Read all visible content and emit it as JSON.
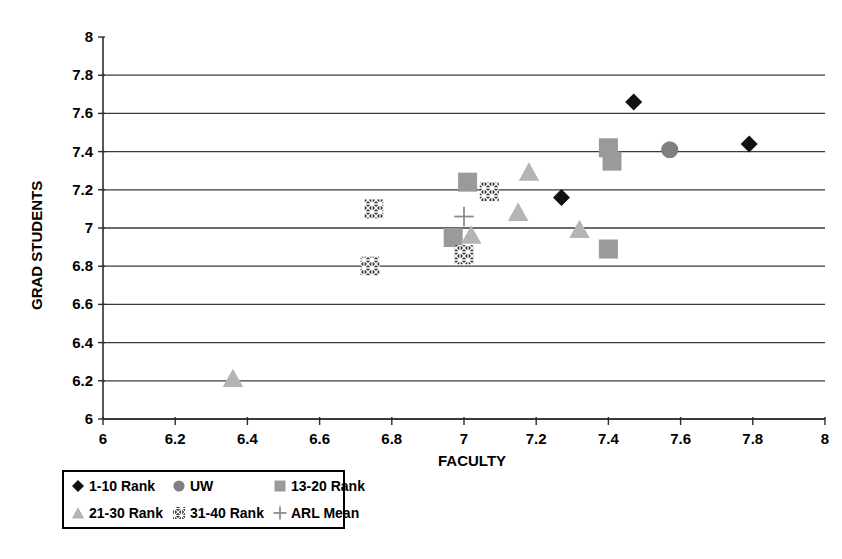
{
  "chart_data": {
    "type": "scatter",
    "title": "",
    "xlabel": "FACULTY",
    "ylabel": "GRAD STUDENTS",
    "xlim": [
      6,
      8
    ],
    "ylim": [
      6,
      8
    ],
    "xticks": [
      "6",
      "6.2",
      "6.4",
      "6.6",
      "6.8",
      "7",
      "7.2",
      "7.4",
      "7.6",
      "7.8",
      "8"
    ],
    "yticks": [
      "6",
      "6.2",
      "6.4",
      "6.6",
      "6.8",
      "7",
      "7.2",
      "7.4",
      "7.6",
      "7.8",
      "8"
    ],
    "xtick_values": [
      6,
      6.2,
      6.4,
      6.6,
      6.8,
      7,
      7.2,
      7.4,
      7.6,
      7.8,
      8
    ],
    "ytick_values": [
      6,
      6.2,
      6.4,
      6.6,
      6.8,
      7,
      7.2,
      7.4,
      7.6,
      7.8,
      8
    ],
    "grid": "horizontal-only",
    "legend_position": "below-left",
    "series": [
      {
        "name": "1-10 Rank",
        "marker": "diamond",
        "color": "#111111",
        "points": [
          {
            "x": 7.47,
            "y": 7.66
          },
          {
            "x": 7.79,
            "y": 7.44
          },
          {
            "x": 7.27,
            "y": 7.16
          }
        ]
      },
      {
        "name": "UW",
        "marker": "circle",
        "color": "#808080",
        "points": [
          {
            "x": 7.57,
            "y": 7.41
          }
        ]
      },
      {
        "name": "13-20 Rank",
        "marker": "square",
        "color": "#9a9a9a",
        "points": [
          {
            "x": 7.4,
            "y": 7.42
          },
          {
            "x": 7.41,
            "y": 7.35
          },
          {
            "x": 7.01,
            "y": 7.24
          },
          {
            "x": 6.97,
            "y": 6.95
          },
          {
            "x": 7.4,
            "y": 6.89
          }
        ]
      },
      {
        "name": "21-30 Rank",
        "marker": "triangle",
        "color": "#b4b4b4",
        "points": [
          {
            "x": 7.18,
            "y": 7.29
          },
          {
            "x": 7.15,
            "y": 7.08
          },
          {
            "x": 7.32,
            "y": 6.99
          },
          {
            "x": 7.02,
            "y": 6.96
          },
          {
            "x": 6.36,
            "y": 6.21
          }
        ]
      },
      {
        "name": "31-40 Rank",
        "marker": "hatched-square",
        "color": "#3c3c3c",
        "points": [
          {
            "x": 7.07,
            "y": 7.19
          },
          {
            "x": 6.75,
            "y": 7.1
          },
          {
            "x": 7.0,
            "y": 6.86
          },
          {
            "x": 6.74,
            "y": 6.8
          }
        ]
      },
      {
        "name": "ARL Mean",
        "marker": "plus",
        "color": "#8c8c8c",
        "points": [
          {
            "x": 7.0,
            "y": 7.06
          }
        ]
      }
    ]
  },
  "legend": {
    "entries": [
      {
        "label": "1-10 Rank",
        "marker": "diamond",
        "color": "#111111"
      },
      {
        "label": "UW",
        "marker": "circle",
        "color": "#808080"
      },
      {
        "label": "13-20 Rank",
        "marker": "square",
        "color": "#9a9a9a"
      },
      {
        "label": "21-30 Rank",
        "marker": "triangle",
        "color": "#b4b4b4"
      },
      {
        "label": "31-40 Rank",
        "marker": "hatched-square",
        "color": "#3c3c3c"
      },
      {
        "label": "ARL Mean",
        "marker": "plus",
        "color": "#8c8c8c"
      }
    ]
  }
}
